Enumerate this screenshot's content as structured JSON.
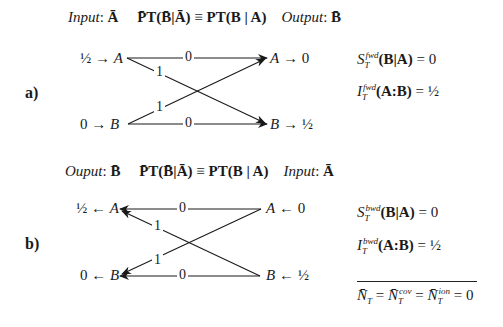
{
  "panel_a": {
    "label": "a)",
    "header": {
      "input_label": "Input",
      "input_var": "Ā",
      "equation_left": "P̄T(B̄|Ā)",
      "equiv": "≡",
      "equation_right": "PT(B | A)",
      "output_label": "Output",
      "output_var": "B̄"
    },
    "left_nodes": [
      {
        "value": "½",
        "arrow": "→",
        "node": "A"
      },
      {
        "value": "0",
        "arrow": "→",
        "node": "B"
      }
    ],
    "right_nodes": [
      {
        "node": "A",
        "arrow": "→",
        "value": "0"
      },
      {
        "node": "B",
        "arrow": "→",
        "value": "½"
      }
    ],
    "edges": [
      {
        "from": "A",
        "to": "A",
        "weight": "0"
      },
      {
        "from": "A",
        "to": "B",
        "weight": "1"
      },
      {
        "from": "B",
        "to": "A",
        "weight": "1"
      },
      {
        "from": "B",
        "to": "B",
        "weight": "0"
      }
    ],
    "results": [
      {
        "symbol": "S",
        "sub": "T",
        "sup": "fwd",
        "arg": "(B|A)",
        "value": "= 0"
      },
      {
        "symbol": "I",
        "sub": "T",
        "sup": "fwd",
        "arg": "(A:B)",
        "value": "= ½"
      }
    ]
  },
  "panel_b": {
    "label": "b)",
    "header": {
      "output_label": "Ouput",
      "output_var": "B̄",
      "equation_left": "P̄T(B̄|Ā)",
      "equiv": "≡",
      "equation_right": "PT(B | A)",
      "input_label": "Input",
      "input_var": "Ā"
    },
    "left_nodes": [
      {
        "value": "½",
        "arrow": "←",
        "node": "A"
      },
      {
        "value": "0",
        "arrow": "←",
        "node": "B"
      }
    ],
    "right_nodes": [
      {
        "node": "A",
        "arrow": "←",
        "value": "0"
      },
      {
        "node": "B",
        "arrow": "←",
        "value": "½"
      }
    ],
    "edges": [
      {
        "from": "A",
        "to": "A",
        "weight": "0"
      },
      {
        "from": "B",
        "to": "A",
        "weight": "1"
      },
      {
        "from": "A",
        "to": "B",
        "weight": "1"
      },
      {
        "from": "B",
        "to": "B",
        "weight": "0"
      }
    ],
    "results": [
      {
        "symbol": "S",
        "sub": "T",
        "sup": "bwd",
        "arg": "(B|A)",
        "value": "= 0"
      },
      {
        "symbol": "I",
        "sub": "T",
        "sup": "bwd",
        "arg": "(A:B)",
        "value": "= ½"
      }
    ]
  },
  "summary": {
    "n1": "N̄",
    "n1_sub": "T",
    "eq1": "=",
    "n2": "N̄",
    "n2_sub": "T",
    "n2_sup": "cov",
    "eq2": "=",
    "n3": "N̄",
    "n3_sub": "T",
    "n3_sup": "ion",
    "value": "= 0"
  }
}
